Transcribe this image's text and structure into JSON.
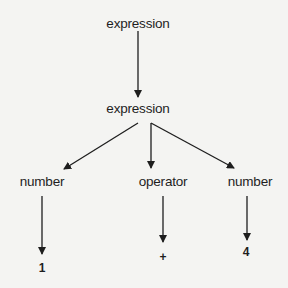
{
  "diagram": {
    "type": "parse-tree",
    "nodes": [
      {
        "id": "root",
        "label": "expression"
      },
      {
        "id": "expr",
        "label": "expression"
      },
      {
        "id": "num1",
        "label": "number"
      },
      {
        "id": "op",
        "label": "operator"
      },
      {
        "id": "num2",
        "label": "number"
      },
      {
        "id": "leaf1",
        "label": "1"
      },
      {
        "id": "leaf_op",
        "label": "+"
      },
      {
        "id": "leaf4",
        "label": "4"
      }
    ],
    "edges": [
      {
        "from": "root",
        "to": "expr"
      },
      {
        "from": "expr",
        "to": "num1"
      },
      {
        "from": "expr",
        "to": "op"
      },
      {
        "from": "expr",
        "to": "num2"
      },
      {
        "from": "num1",
        "to": "leaf1"
      },
      {
        "from": "op",
        "to": "leaf_op"
      },
      {
        "from": "num2",
        "to": "leaf4"
      }
    ],
    "colors": {
      "ink": "#1e1e1e",
      "background": "#f4f4f2"
    }
  }
}
